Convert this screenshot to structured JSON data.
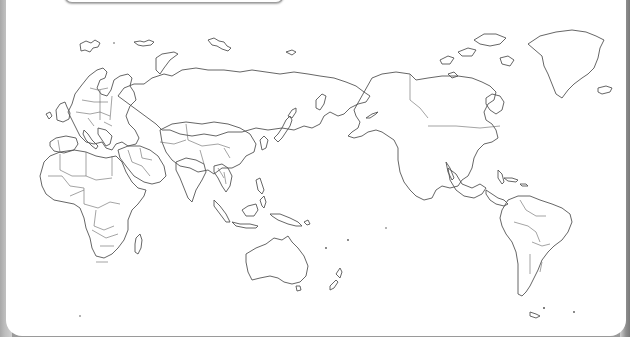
{
  "map": {
    "title": "World map outline (Pacific-centered)",
    "style": "blank political outline map",
    "stroke_color": "#555555",
    "background_color": "#ffffff",
    "frame_color": "#9a9a9a",
    "regions": [
      "Europe",
      "Africa",
      "Middle East",
      "Asia",
      "Russia",
      "Southeast Asia",
      "Australia",
      "New Zealand",
      "North America",
      "Greenland",
      "Central America",
      "South America"
    ],
    "labels_visible": false
  }
}
